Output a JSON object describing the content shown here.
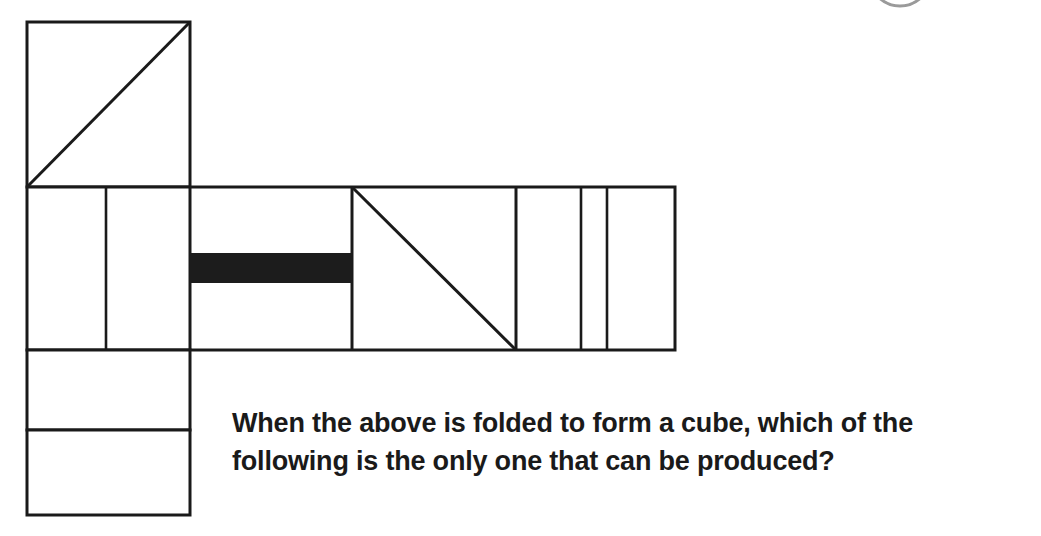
{
  "canvas": {
    "width": 1041,
    "height": 536,
    "background": "#ffffff"
  },
  "style": {
    "stroke_color": "#1a1a1a",
    "fill_color": "#ffffff",
    "solid_fill_color": "#1c1c1c",
    "arc_color": "#9a9a9a",
    "stroke_width": 3,
    "thin_stroke_width": 2.6
  },
  "question": {
    "line1": "When the above is folded to form a cube, which of the",
    "line2": "following is the only one that can be produced?",
    "full_text": "When the above is folded to form a cube, which of the following is the only one that can be produced?"
  },
  "figure": {
    "label": "cube-net-diagram",
    "top_square": {
      "x": 27,
      "y": 22,
      "w": 163,
      "h": 165
    },
    "middle_row": {
      "x": 27,
      "y": 187,
      "w": 648,
      "h": 163
    },
    "middle_dividers_x": [
      106,
      190,
      352,
      516,
      581,
      607
    ],
    "bottom_cells": [
      {
        "x": 27,
        "y": 350,
        "w": 163,
        "h": 80
      },
      {
        "x": 27,
        "y": 430,
        "w": 163,
        "h": 85
      }
    ],
    "diagonals": [
      {
        "name": "top-square-diagonal",
        "x1": 27,
        "y1": 187,
        "x2": 190,
        "y2": 22
      },
      {
        "name": "middle-cell-diagonal",
        "x1": 352,
        "y1": 187,
        "x2": 516,
        "y2": 350
      }
    ],
    "black_bar": {
      "x": 190,
      "y": 253,
      "w": 162,
      "h": 30
    },
    "corner_arc": {
      "cx": 900,
      "cy": -28,
      "rx": 32,
      "ry": 34
    }
  }
}
